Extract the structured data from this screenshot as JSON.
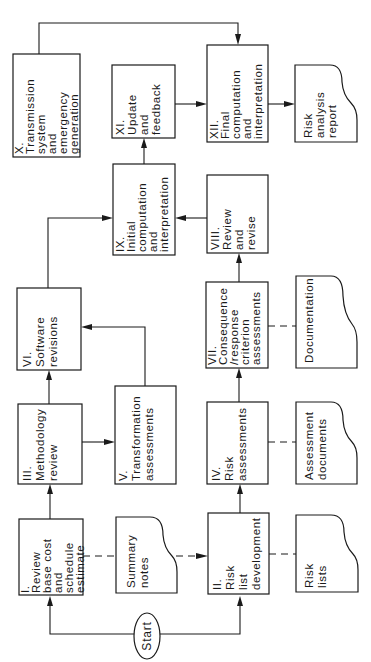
{
  "diagram": {
    "title": "",
    "orientation": "rotated -90deg (reads bottom-to-top)",
    "start": {
      "label": "Start"
    },
    "processes": {
      "p1": {
        "num": "I.",
        "lines": [
          "Review",
          "base cost",
          "and",
          "schedule",
          "estimate"
        ]
      },
      "p2": {
        "num": "II.",
        "lines": [
          "Risk",
          "list",
          "development"
        ]
      },
      "p3": {
        "num": "III.",
        "lines": [
          "Methodology",
          "review"
        ]
      },
      "p4": {
        "num": "IV.",
        "lines": [
          "Risk",
          "assessments"
        ]
      },
      "p5": {
        "num": "V.",
        "lines": [
          "Transformation",
          "assessments"
        ]
      },
      "p6": {
        "num": "VI.",
        "lines": [
          "Software",
          "revisions"
        ]
      },
      "p7": {
        "num": "VII.",
        "lines": [
          "Consequence",
          "/response",
          "criterion",
          "assessments"
        ]
      },
      "p8": {
        "num": "VIII.",
        "lines": [
          "Review",
          "and",
          "revise"
        ]
      },
      "p9": {
        "num": "IX.",
        "lines": [
          "Initial",
          "computation",
          "and",
          "interpretation"
        ]
      },
      "p10": {
        "num": "X.",
        "lines": [
          "Transmission",
          "system",
          "and",
          "emergency",
          "generation"
        ]
      },
      "p11": {
        "num": "XI.",
        "lines": [
          "Update",
          "and",
          "feedback"
        ]
      },
      "p12": {
        "num": "XII.",
        "lines": [
          "Final",
          "computation",
          "and",
          "interpretation"
        ]
      }
    },
    "documents": {
      "d1": {
        "lines": [
          "Summary",
          "notes"
        ]
      },
      "d2": {
        "lines": [
          "Risk",
          "lists"
        ]
      },
      "d3": {
        "lines": [
          "Assessment",
          "documents"
        ]
      },
      "d4": {
        "lines": [
          "Documentation"
        ]
      },
      "d5": {
        "lines": [
          "Risk",
          "analysis",
          "report"
        ]
      }
    },
    "connections": [
      {
        "from": "Start",
        "to": "I.",
        "type": "solid-arrow"
      },
      {
        "from": "Start",
        "to": "II.",
        "type": "solid-arrow"
      },
      {
        "from": "I.",
        "to": "Summary notes",
        "type": "dashed"
      },
      {
        "from": "Summary notes",
        "to": "II.",
        "type": "dashed-arrow"
      },
      {
        "from": "II.",
        "to": "Risk lists",
        "type": "dashed"
      },
      {
        "from": "I.",
        "to": "III.",
        "type": "solid-arrow"
      },
      {
        "from": "II.",
        "to": "IV.",
        "type": "solid-arrow"
      },
      {
        "from": "III.",
        "to": "V.",
        "type": "solid-arrow"
      },
      {
        "from": "III.",
        "to": "VI.",
        "type": "solid-arrow"
      },
      {
        "from": "V.",
        "to": "VI.",
        "type": "solid-arrow"
      },
      {
        "from": "IV.",
        "to": "Assessment documents",
        "type": "dashed"
      },
      {
        "from": "IV.",
        "to": "VII.",
        "type": "solid-arrow"
      },
      {
        "from": "VII.",
        "to": "Documentation",
        "type": "dashed"
      },
      {
        "from": "VII.",
        "to": "VIII.",
        "type": "solid-arrow"
      },
      {
        "from": "VI.",
        "to": "IX.",
        "type": "solid-arrow"
      },
      {
        "from": "VIII.",
        "to": "IX.",
        "type": "solid-arrow"
      },
      {
        "from": "IX.",
        "to": "XI.",
        "type": "solid-arrow"
      },
      {
        "from": "XI.",
        "to": "XII.",
        "type": "solid-arrow"
      },
      {
        "from": "X.",
        "to": "XII.",
        "type": "solid-arrow"
      },
      {
        "from": "XII.",
        "to": "Risk analysis report",
        "type": "solid-arrow"
      }
    ]
  }
}
